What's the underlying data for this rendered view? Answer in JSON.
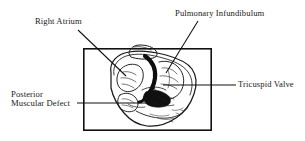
{
  "figure": {
    "type": "anatomical-line-drawing",
    "frame": {
      "x": 83,
      "y": 48,
      "width": 129,
      "height": 83,
      "stroke_color": "#111111",
      "stroke_width": 1.6,
      "fill": "#ffffff"
    },
    "background_color": "#ffffff",
    "ink_color": "#111111"
  },
  "labels": {
    "right_atrium": {
      "text": "Right Atrium",
      "leader": {
        "x1": 78,
        "y1": 30,
        "x2": 126,
        "y2": 76
      }
    },
    "pulmonary_infundibulum": {
      "text": "Pulmonary Infundibulum",
      "leader": {
        "x1": 198,
        "y1": 21,
        "x2": 166,
        "y2": 73
      }
    },
    "tricuspid_valve": {
      "text": "Tricuspid Valve",
      "leader": {
        "x1": 236,
        "y1": 85,
        "x2": 163,
        "y2": 85
      }
    },
    "posterior_muscular_defect": {
      "line1": "Posterior",
      "line2": "Muscular Defect",
      "leader": {
        "x1": 77,
        "y1": 103,
        "x2": 146,
        "y2": 103
      }
    }
  }
}
